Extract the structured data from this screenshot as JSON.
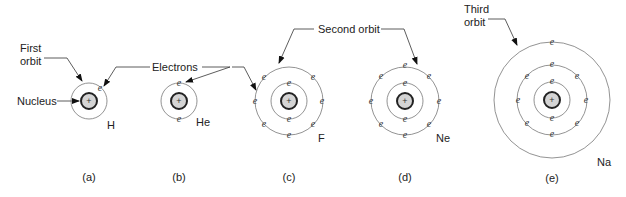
{
  "figure": {
    "annotations": {
      "first_orbit": "First orbit",
      "first_orbit_line1": "First",
      "first_orbit_line2": "orbit",
      "nucleus": "Nucleus",
      "electrons": "Electrons",
      "second_orbit": "Second orbit",
      "third_orbit_line1": "Third",
      "third_orbit_line2": "orbit"
    },
    "electron_symbol": "e",
    "nucleus_symbol": "+",
    "atoms": [
      {
        "panel": "(a)",
        "element": "H",
        "electrons": 1,
        "shells": [
          1
        ]
      },
      {
        "panel": "(b)",
        "element": "He",
        "electrons": 2,
        "shells": [
          2
        ]
      },
      {
        "panel": "(c)",
        "element": "F",
        "electrons": 9,
        "shells": [
          2,
          7
        ]
      },
      {
        "panel": "(d)",
        "element": "Ne",
        "electrons": 10,
        "shells": [
          2,
          8
        ]
      },
      {
        "panel": "(e)",
        "element": "Na",
        "electrons": 11,
        "shells": [
          2,
          8,
          1
        ]
      }
    ]
  }
}
